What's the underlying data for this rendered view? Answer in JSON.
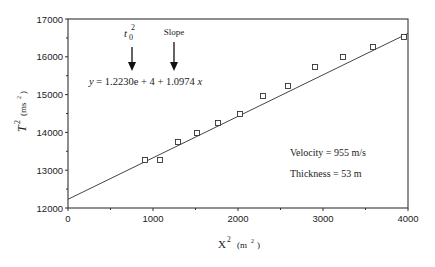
{
  "chart_data": {
    "type": "scatter",
    "title": "",
    "xlabel": "X² (m²)",
    "ylabel": "T² (ms²)",
    "xlim": [
      0,
      4000
    ],
    "ylim": [
      12000,
      17000
    ],
    "x_ticks": [
      0,
      1000,
      2000,
      3000,
      4000
    ],
    "y_ticks": [
      12000,
      13000,
      14000,
      15000,
      16000,
      17000
    ],
    "grid": false,
    "series": [
      {
        "name": "measured",
        "marker": "square",
        "x": [
          906,
          1082,
          1294,
          1518,
          1765,
          2024,
          2294,
          2588,
          2906,
          3235,
          3588,
          3953
        ],
        "y": [
          13270,
          13270,
          13746,
          13984,
          14249,
          14487,
          14963,
          15228,
          15730,
          15995,
          16259,
          16524
        ]
      },
      {
        "name": "fit",
        "type": "line",
        "intercept": 12230,
        "slope": 1.0974,
        "x": [
          0,
          4000
        ],
        "y": [
          12230,
          16620
        ]
      }
    ],
    "annotations": {
      "equation": "y = 1.2230e + 4 + 1.0974x",
      "t0_label": "t",
      "t0_sub": "0",
      "t0_sup": "2",
      "slope_label": "Slope",
      "velocity": "Velocity = 955 m/s",
      "thickness": "Thickness = 53 m"
    }
  },
  "axis": {
    "y_label_main": "T",
    "y_label_sup": "2",
    "y_label_unit": "(ms",
    "y_label_unit_sup": "2",
    "y_label_close": ")",
    "x_label_main": "X",
    "x_label_sup": "2",
    "x_label_unit": "(m",
    "x_label_unit_sup": "2",
    "x_label_close": ")"
  }
}
